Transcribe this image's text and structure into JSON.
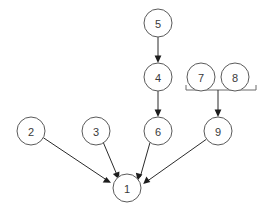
{
  "diagram": {
    "background_color": "#ffffff",
    "node_fill": "#ffffff",
    "node_stroke": "#5a5a5a",
    "edge_color": "#2b2b2b",
    "bracket_color": "#6a6a6a",
    "label_color": "#3a3a3a",
    "node_radius": 14,
    "nodes": [
      {
        "id": "1",
        "label": "1",
        "x": 127,
        "y": 188
      },
      {
        "id": "2",
        "label": "2",
        "x": 31,
        "y": 131
      },
      {
        "id": "3",
        "label": "3",
        "x": 96,
        "y": 131
      },
      {
        "id": "4",
        "label": "4",
        "x": 158,
        "y": 77
      },
      {
        "id": "5",
        "label": "5",
        "x": 158,
        "y": 23
      },
      {
        "id": "6",
        "label": "6",
        "x": 158,
        "y": 131
      },
      {
        "id": "7",
        "label": "7",
        "x": 201,
        "y": 77
      },
      {
        "id": "8",
        "label": "8",
        "x": 235,
        "y": 77
      },
      {
        "id": "9",
        "label": "9",
        "x": 218,
        "y": 131
      }
    ],
    "edges": [
      {
        "from": "5",
        "to": "4",
        "arrow": true
      },
      {
        "from": "4",
        "to": "6",
        "arrow": true
      },
      {
        "from": "6",
        "to": "1",
        "arrow": true
      },
      {
        "from": "2",
        "to": "1",
        "arrow": true
      },
      {
        "from": "3",
        "to": "1",
        "arrow": true
      },
      {
        "from": "9",
        "to": "1",
        "arrow": true
      }
    ],
    "bracket": {
      "groups": [
        "7",
        "8"
      ],
      "target": "9",
      "left_x": 186,
      "right_x": 256,
      "y": 90,
      "tick_height": 5,
      "stem_x": 218,
      "stem_to_y": 117,
      "arrow": true
    }
  }
}
